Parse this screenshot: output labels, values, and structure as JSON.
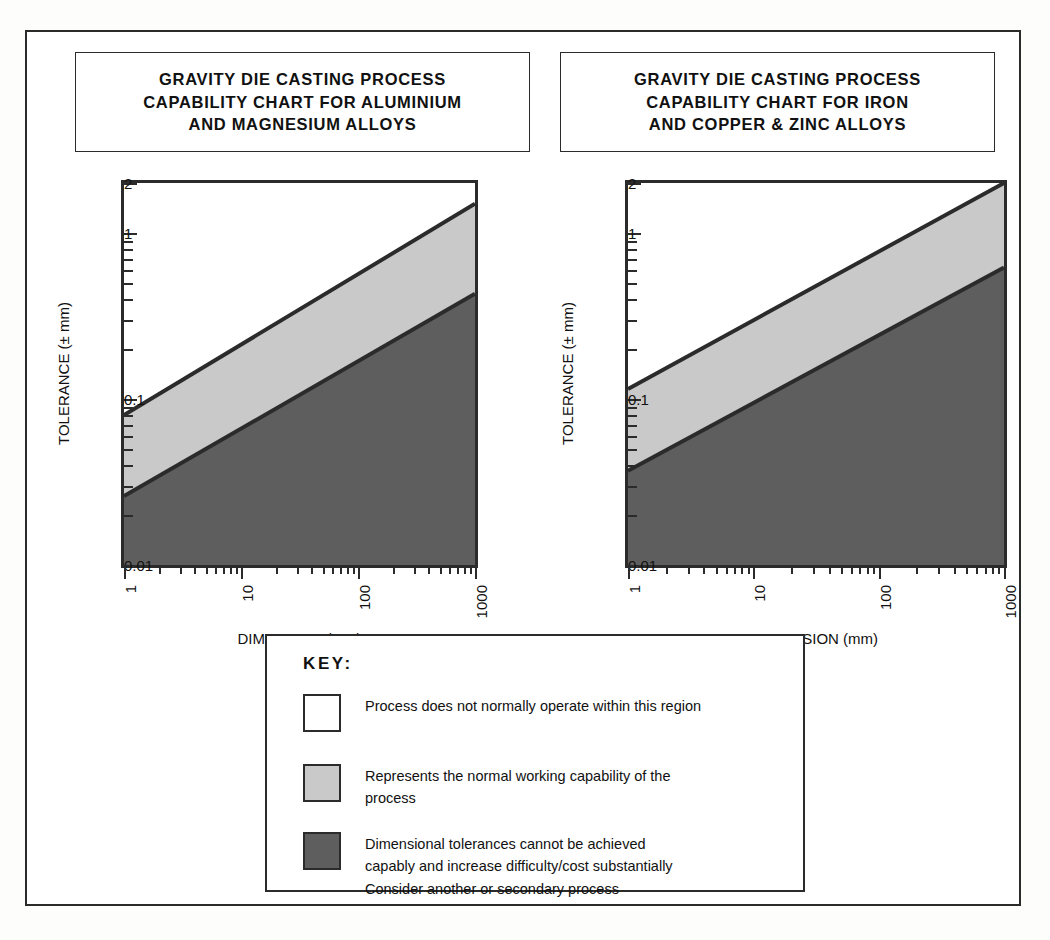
{
  "charts": [
    {
      "id": "aluminium-magnesium",
      "title": "GRAVITY DIE CASTING PROCESS CAPABILITY CHART FOR ALUMINIUM AND MAGNESIUM ALLOYS",
      "title_lines": [
        "GRAVITY DIE CASTING PROCESS",
        "CAPABILITY CHART FOR ALUMINIUM",
        "AND MAGNESIUM ALLOYS"
      ],
      "xlabel": "DIMENSION (mm)",
      "ylabel": "TOLERANCE (± mm)"
    },
    {
      "id": "iron-copper-zinc",
      "title": "GRAVITY DIE CASTING PROCESS CAPABILITY CHART FOR IRON AND COPPER & ZINC ALLOYS",
      "title_lines": [
        "GRAVITY DIE CASTING PROCESS",
        "CAPABILITY CHART FOR IRON",
        "AND COPPER & ZINC ALLOYS"
      ],
      "xlabel": "DIMENSION (mm)",
      "ylabel": "TOLERANCE (± mm)"
    }
  ],
  "key": {
    "title": "KEY:",
    "items": [
      {
        "swatch": "white",
        "color": "#ffffff",
        "lines": [
          "Process does not normally operate within this region"
        ]
      },
      {
        "swatch": "light-grey",
        "color": "#c9c9c9",
        "lines": [
          "Represents the normal working capability of the",
          "process"
        ]
      },
      {
        "swatch": "dark-grey",
        "color": "#5e5e5e",
        "lines": [
          "Dimensional tolerances cannot be achieved",
          "capably and increase difficulty/cost substantially",
          "Consider another or secondary process"
        ]
      }
    ]
  },
  "chart_data": [
    {
      "type": "area",
      "id": "aluminium-magnesium",
      "title": "GRAVITY DIE CASTING PROCESS CAPABILITY CHART FOR ALUMINIUM AND MAGNESIUM ALLOYS",
      "xlabel": "DIMENSION (mm)",
      "ylabel": "TOLERANCE (± mm)",
      "xscale": "log",
      "yscale": "log",
      "xlim": [
        1,
        1000
      ],
      "ylim": [
        0.01,
        2
      ],
      "xticks": [
        1,
        10,
        100,
        1000
      ],
      "xticklabels": [
        "1",
        "10",
        "100",
        "1000"
      ],
      "yticks": [
        0.01,
        0.1,
        1,
        2
      ],
      "yticklabels": [
        "0.01",
        "0.1",
        "1",
        "2"
      ],
      "grid": false,
      "legend": "external-key-box",
      "boundaries": [
        {
          "name": "upper-capability-boundary",
          "description": "top of normal working capability band",
          "x": [
            1,
            1000
          ],
          "y": [
            0.08,
            1.5
          ]
        },
        {
          "name": "lower-capability-boundary",
          "description": "bottom of normal working capability band",
          "x": [
            1,
            1000
          ],
          "y": [
            0.026,
            0.43
          ]
        }
      ],
      "regions": [
        {
          "name": "not-normally-operated",
          "fill": "#ffffff",
          "position": "above upper boundary"
        },
        {
          "name": "normal-working-capability",
          "fill": "#c9c9c9",
          "position": "between boundaries"
        },
        {
          "name": "difficult-costly",
          "fill": "#5e5e5e",
          "position": "below lower boundary"
        }
      ]
    },
    {
      "type": "area",
      "id": "iron-copper-zinc",
      "title": "GRAVITY DIE CASTING PROCESS CAPABILITY CHART FOR IRON AND COPPER & ZINC ALLOYS",
      "xlabel": "DIMENSION (mm)",
      "ylabel": "TOLERANCE (± mm)",
      "xscale": "log",
      "yscale": "log",
      "xlim": [
        1,
        1000
      ],
      "ylim": [
        0.01,
        2
      ],
      "xticks": [
        1,
        10,
        100,
        1000
      ],
      "xticklabels": [
        "1",
        "10",
        "100",
        "1000"
      ],
      "yticks": [
        0.01,
        0.1,
        1,
        2
      ],
      "yticklabels": [
        "0.01",
        "0.1",
        "1",
        "2"
      ],
      "grid": false,
      "legend": "external-key-box",
      "boundaries": [
        {
          "name": "upper-capability-boundary",
          "description": "top of normal working capability band",
          "x": [
            1,
            1000
          ],
          "y": [
            0.115,
            2.0
          ]
        },
        {
          "name": "lower-capability-boundary",
          "description": "bottom of normal working capability band",
          "x": [
            1,
            1000
          ],
          "y": [
            0.037,
            0.62
          ]
        }
      ],
      "regions": [
        {
          "name": "not-normally-operated",
          "fill": "#ffffff",
          "position": "above upper boundary"
        },
        {
          "name": "normal-working-capability",
          "fill": "#c9c9c9",
          "position": "between boundaries"
        },
        {
          "name": "difficult-costly",
          "fill": "#5e5e5e",
          "position": "below lower boundary"
        }
      ]
    }
  ]
}
